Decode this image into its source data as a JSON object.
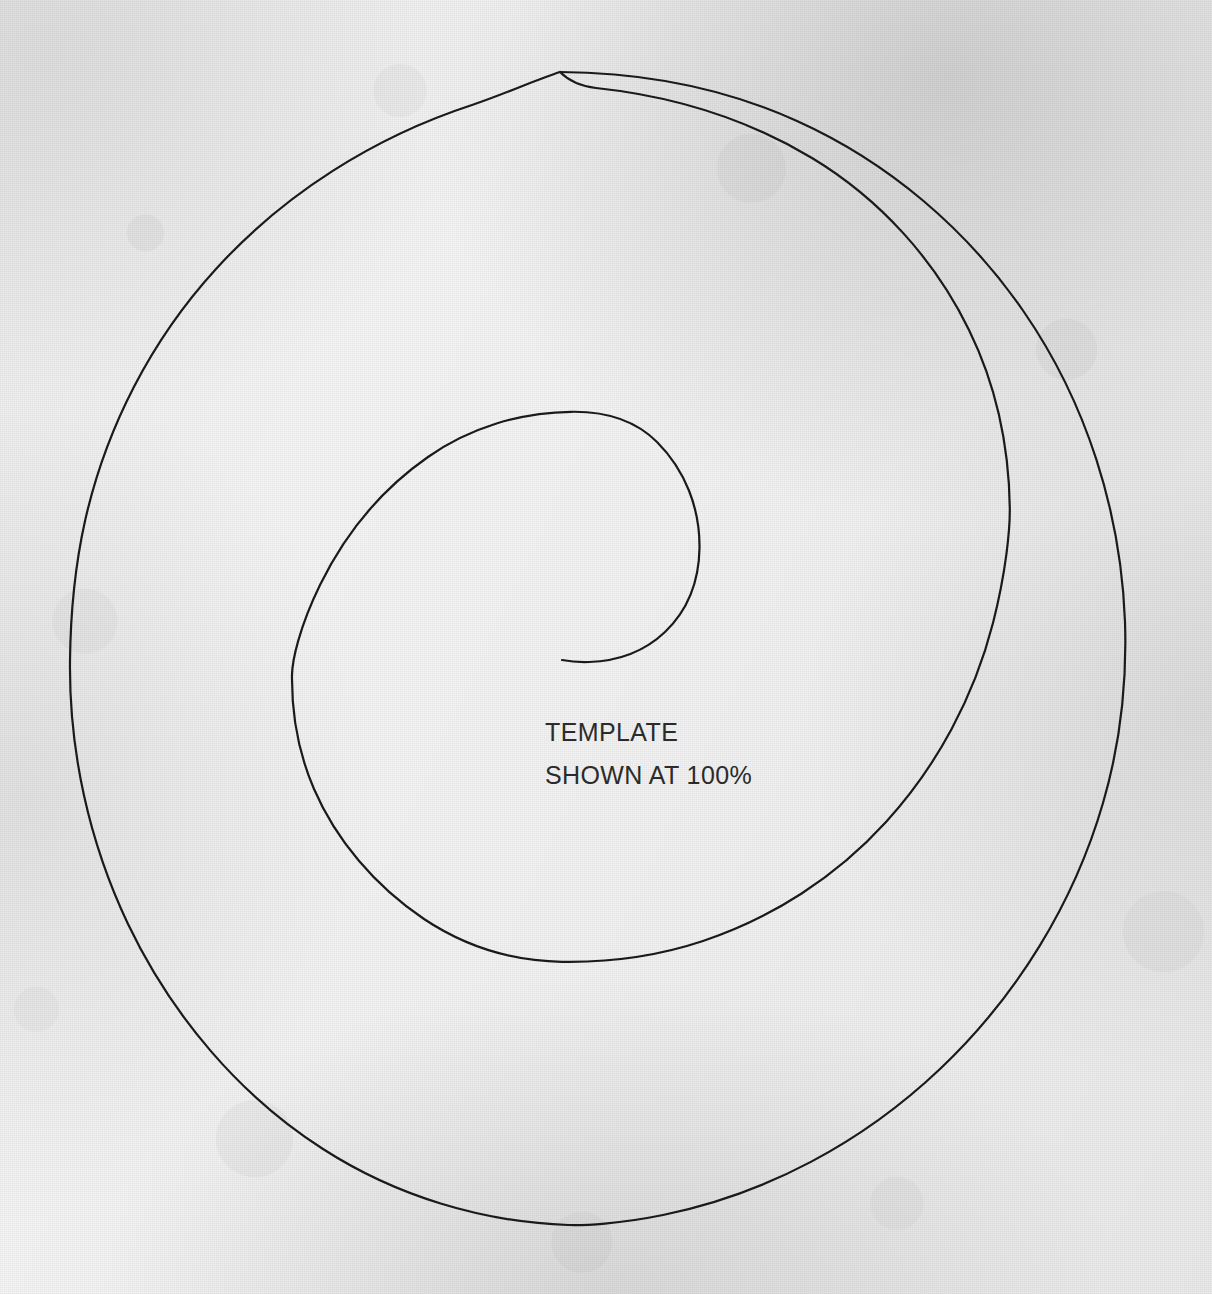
{
  "page": {
    "width": 1212,
    "height": 1294,
    "background_color": "#f1f1f1",
    "ink_color": "#1a1a1a",
    "paper_description": "textured light-grey paper"
  },
  "artwork": {
    "name": "spiral-template",
    "type": "archimedean-spiral",
    "stroke_color": "#1a1a1a",
    "stroke_width": 2.2,
    "fill": "none",
    "center_x": 600,
    "center_y": 650,
    "turns": 1.85,
    "inner_terminus": {
      "x": 562,
      "y": 660
    },
    "outer_terminus": {
      "x": 560,
      "y": 72
    },
    "extents": {
      "outer_left": 57,
      "outer_right": 1170,
      "outer_top": 72,
      "outer_bottom": 1225,
      "inner_left": 292,
      "inner_right": 1010,
      "inner_top": 412,
      "inner_bottom": 962
    }
  },
  "caption": {
    "line1": "TEMPLATE",
    "line2": "SHOWN AT 100%",
    "color": "#2b2b2b",
    "font_size_px": 25,
    "x": 545,
    "line1_y": 722,
    "line2_y": 765
  }
}
